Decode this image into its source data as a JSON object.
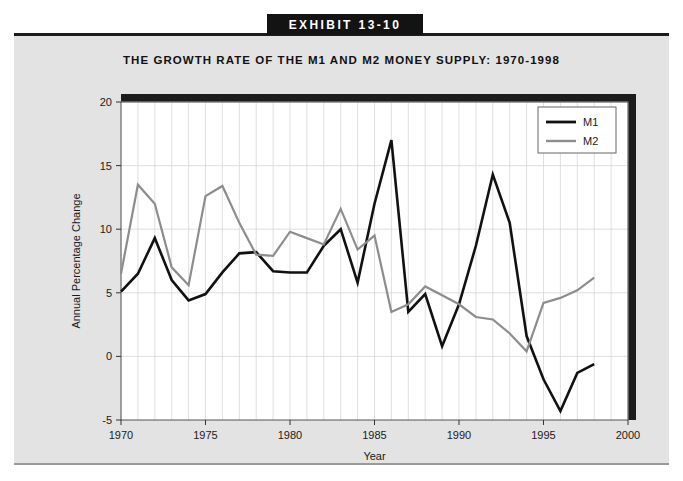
{
  "exhibit": {
    "banner_label": "EXHIBIT 13-10"
  },
  "chart_data": {
    "type": "line",
    "title": "THE GROWTH RATE OF THE M1 AND M2 MONEY SUPPLY: 1970-1998",
    "xlabel": "Year",
    "ylabel": "Annual Percentage Change",
    "xlim": [
      1970,
      2000
    ],
    "ylim": [
      -5,
      20
    ],
    "xticks": [
      1970,
      1975,
      1980,
      1985,
      1990,
      1995,
      2000
    ],
    "xtick_labels": [
      "1970",
      "1975",
      "1980",
      "1985",
      "1990",
      "1995",
      "2000"
    ],
    "yticks": [
      -5,
      0,
      5,
      10,
      15,
      20
    ],
    "ytick_labels": [
      "-5",
      "0",
      "5",
      "10",
      "15",
      "20"
    ],
    "grid": true,
    "grid_minor_x_step": 1,
    "legend_position": "top-right",
    "x": [
      1970,
      1971,
      1972,
      1973,
      1974,
      1975,
      1976,
      1977,
      1978,
      1979,
      1980,
      1981,
      1982,
      1983,
      1984,
      1985,
      1986,
      1987,
      1988,
      1989,
      1990,
      1991,
      1992,
      1993,
      1994,
      1995,
      1996,
      1997,
      1998
    ],
    "series": [
      {
        "name": "M1",
        "color": "#111111",
        "values": [
          5.1,
          6.5,
          9.3,
          6.0,
          4.4,
          4.9,
          6.6,
          8.1,
          8.2,
          6.7,
          6.6,
          6.6,
          8.7,
          10.0,
          5.8,
          12.0,
          17.0,
          3.5,
          4.9,
          0.8,
          4.1,
          8.7,
          14.3,
          10.5,
          1.6,
          -1.8,
          -4.3,
          -1.3,
          -0.6
        ]
      },
      {
        "name": "M2",
        "color": "#8d8d8d",
        "values": [
          6.5,
          13.5,
          12.0,
          7.0,
          5.6,
          12.6,
          13.4,
          10.5,
          8.0,
          7.9,
          9.8,
          9.3,
          8.8,
          11.6,
          8.4,
          9.5,
          3.5,
          4.1,
          5.5,
          4.8,
          4.1,
          3.1,
          2.9,
          1.8,
          0.4,
          4.2,
          4.6,
          5.2,
          6.2
        ]
      }
    ]
  }
}
